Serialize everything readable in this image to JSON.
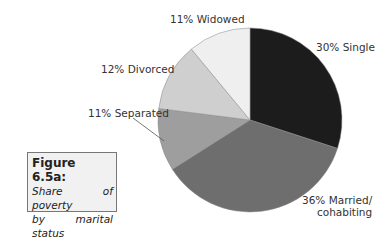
{
  "chart_data": {
    "type": "pie",
    "title": "Figure 6.5a: Share of poverty by marital status of HR",
    "categories": [
      "Single",
      "Married/cohabiting",
      "Separated",
      "Divorced",
      "Widowed"
    ],
    "values": [
      30,
      36,
      11,
      12,
      11
    ],
    "unit": "%",
    "colors": [
      "#1c1c1c",
      "#6e6e6e",
      "#9e9e9e",
      "#cfcfcf",
      "#efefef"
    ],
    "start_angle": "12 o'clock",
    "direction": "clockwise",
    "legend": "none (direct labels)"
  },
  "labels": {
    "single": "30% Single",
    "married_line1": "36%  Married/",
    "married_line2": "cohabiting",
    "separated": "11% Separated",
    "divorced": "12% Divorced",
    "widowed": "11% Widowed"
  },
  "caption": {
    "title": "Figure 6.5a:",
    "line1": "Share of poverty",
    "line2": "by marital status",
    "line3": "of HR"
  }
}
